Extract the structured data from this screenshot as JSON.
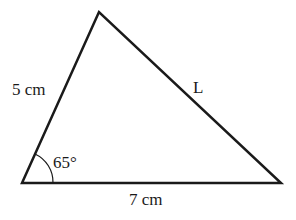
{
  "diagram": {
    "type": "triangle",
    "vertices": {
      "top": [
        99,
        12
      ],
      "bottom_left": [
        22,
        183
      ],
      "bottom_right": [
        281,
        183
      ]
    },
    "labels": {
      "left_side": "5 cm",
      "right_side": "L",
      "base": "7 cm",
      "angle": "65°"
    },
    "stroke_color": "#1a1a1a"
  }
}
